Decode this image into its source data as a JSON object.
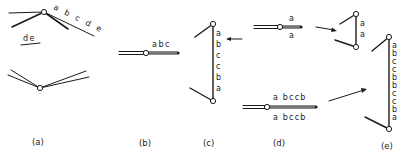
{
  "figure": {
    "panels": [
      {
        "id": "a",
        "caption": "(a)",
        "labels": {
          "upper_diag": "a b c d e",
          "short_segment": "de"
        }
      },
      {
        "id": "b",
        "caption": "(b)",
        "labels": {
          "top": "abc"
        }
      },
      {
        "id": "c",
        "caption": "(c)",
        "labels": {
          "vertical": [
            "a",
            "b",
            "c",
            "c",
            "b",
            "a"
          ]
        }
      },
      {
        "id": "d",
        "caption": "(d)",
        "labels": {
          "upper_top": "a",
          "upper_bottom": "a",
          "lower_top": "a bccb",
          "lower_bottom": "a bccb"
        }
      },
      {
        "id": "e",
        "caption": "(e)",
        "labels": {
          "small_vertical": [
            "a",
            "a"
          ],
          "large_vertical": [
            "a",
            "b",
            "c",
            "c",
            "b",
            "b",
            "c",
            "c",
            "b",
            "a"
          ]
        }
      }
    ]
  }
}
